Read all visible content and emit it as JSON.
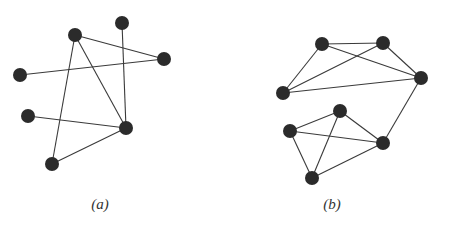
{
  "style": {
    "node_color": "#2b2b2b",
    "edge_color": "#3a3a3a",
    "node_radius": 7,
    "edge_width": 1.1
  },
  "graphs": [
    {
      "id": "a",
      "caption": "(a)",
      "caption_x": 100,
      "nodes": [
        {
          "id": "a1",
          "x": 75,
          "y": 35
        },
        {
          "id": "a2",
          "x": 122,
          "y": 23
        },
        {
          "id": "a3",
          "x": 164,
          "y": 59
        },
        {
          "id": "a4",
          "x": 20,
          "y": 75
        },
        {
          "id": "a5",
          "x": 28,
          "y": 116
        },
        {
          "id": "a6",
          "x": 126,
          "y": 128
        },
        {
          "id": "a7",
          "x": 52,
          "y": 164
        }
      ],
      "edges": [
        [
          "a1",
          "a3"
        ],
        [
          "a1",
          "a6"
        ],
        [
          "a1",
          "a7"
        ],
        [
          "a2",
          "a6"
        ],
        [
          "a4",
          "a3"
        ],
        [
          "a5",
          "a6"
        ],
        [
          "a6",
          "a7"
        ]
      ]
    },
    {
      "id": "b",
      "caption": "(b)",
      "caption_x": 332,
      "nodes": [
        {
          "id": "b1",
          "x": 322,
          "y": 44
        },
        {
          "id": "b2",
          "x": 383,
          "y": 43
        },
        {
          "id": "b3",
          "x": 421,
          "y": 78
        },
        {
          "id": "b4",
          "x": 283,
          "y": 93
        },
        {
          "id": "b5",
          "x": 340,
          "y": 111
        },
        {
          "id": "b6",
          "x": 290,
          "y": 131
        },
        {
          "id": "b7",
          "x": 383,
          "y": 143
        },
        {
          "id": "b8",
          "x": 312,
          "y": 178
        }
      ],
      "edges": [
        [
          "b1",
          "b2"
        ],
        [
          "b1",
          "b3"
        ],
        [
          "b1",
          "b4"
        ],
        [
          "b2",
          "b3"
        ],
        [
          "b2",
          "b4"
        ],
        [
          "b4",
          "b3"
        ],
        [
          "b3",
          "b7"
        ],
        [
          "b5",
          "b6"
        ],
        [
          "b5",
          "b7"
        ],
        [
          "b5",
          "b8"
        ],
        [
          "b6",
          "b7"
        ],
        [
          "b6",
          "b8"
        ],
        [
          "b8",
          "b7"
        ]
      ]
    }
  ]
}
